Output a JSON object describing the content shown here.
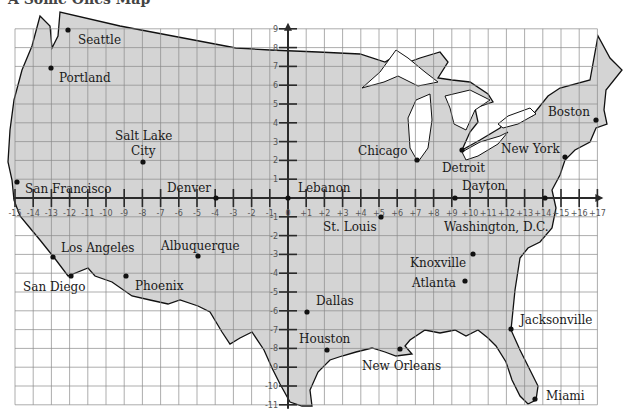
{
  "title_fragment": "A Some Ones Map",
  "grid": {
    "origin_px": [
      288,
      198
    ],
    "unit_x_px": 18.2,
    "unit_y_px": 18.8,
    "x_range": [
      -15,
      17
    ],
    "y_range": [
      -11,
      9
    ],
    "colors": {
      "land": "#d4d4d4",
      "water": "#ffffff",
      "grid": "#8a8a8a",
      "axis": "#2a2a2a",
      "outline": "#111111"
    }
  },
  "x_tick_labels": [
    "-15",
    "-14",
    "-13",
    "-12",
    "-11",
    "-10",
    "-9",
    "-8",
    "-7",
    "-6",
    "-5",
    "-4",
    "-3",
    "-2",
    "-1",
    "0",
    "+1",
    "+2",
    "+3",
    "+4",
    "+5",
    "+6",
    "+7",
    "+8",
    "+9",
    "+10",
    "+11",
    "+12",
    "+13",
    "+14",
    "+15",
    "+16",
    "+17"
  ],
  "y_tick_labels": [
    "9",
    "8",
    "7",
    "6",
    "5",
    "4",
    "3",
    "2",
    "1",
    "-1",
    "-2",
    "-3",
    "-4",
    "-5",
    "-6",
    "-7",
    "-8",
    "-9",
    "-10",
    "-11"
  ],
  "cities": [
    {
      "name": "Seattle",
      "dot": [
        68,
        30
      ],
      "label": [
        78,
        44
      ]
    },
    {
      "name": "Portland",
      "dot": [
        51,
        68
      ],
      "label": [
        59,
        82
      ]
    },
    {
      "name": "Salt Lake",
      "dot": [
        143,
        162
      ],
      "label": [
        115,
        140
      ]
    },
    {
      "name": "City",
      "dot": null,
      "label": [
        131,
        155
      ]
    },
    {
      "name": "San Francisco",
      "dot": [
        17,
        182
      ],
      "label": [
        25,
        193
      ]
    },
    {
      "name": "Denver",
      "dot": [
        216,
        198
      ],
      "label": [
        167,
        192
      ]
    },
    {
      "name": "Lebanon",
      "dot": [
        288,
        198
      ],
      "label": [
        298,
        192
      ]
    },
    {
      "name": "Chicago",
      "dot": [
        417,
        160
      ],
      "label": [
        358,
        155
      ]
    },
    {
      "name": "Detroit",
      "dot": [
        462,
        150
      ],
      "label": [
        442,
        172
      ]
    },
    {
      "name": "Dayton",
      "dot": [
        455,
        198
      ],
      "label": [
        462,
        190
      ]
    },
    {
      "name": "Boston",
      "dot": [
        596,
        120
      ],
      "label": [
        548,
        116
      ]
    },
    {
      "name": "New York",
      "dot": [
        565,
        157
      ],
      "label": [
        501,
        153
      ]
    },
    {
      "name": "Washington, D.C.",
      "dot": [
        545,
        198
      ],
      "label": [
        444,
        231
      ]
    },
    {
      "name": "St. Louis",
      "dot": [
        381,
        217
      ],
      "label": [
        323,
        231
      ]
    },
    {
      "name": "Los Angeles",
      "dot": [
        53,
        257
      ],
      "label": [
        61,
        252
      ]
    },
    {
      "name": "San Diego",
      "dot": [
        71,
        276
      ],
      "label": [
        23,
        291
      ]
    },
    {
      "name": "Albuquerque",
      "dot": [
        198,
        256
      ],
      "label": [
        161,
        250
      ]
    },
    {
      "name": "Phoenix",
      "dot": [
        126,
        276
      ],
      "label": [
        135,
        290
      ]
    },
    {
      "name": "Knoxville",
      "dot": [
        473,
        254
      ],
      "label": [
        410,
        267
      ]
    },
    {
      "name": "Atlanta",
      "dot": [
        465,
        281
      ],
      "label": [
        412,
        287
      ]
    },
    {
      "name": "Dallas",
      "dot": [
        307,
        312
      ],
      "label": [
        316,
        305
      ]
    },
    {
      "name": "Houston",
      "dot": [
        327,
        350
      ],
      "label": [
        299,
        343
      ]
    },
    {
      "name": "New Orleans",
      "dot": [
        400,
        349
      ],
      "label": [
        362,
        370
      ]
    },
    {
      "name": "Jacksonville",
      "dot": [
        511,
        329
      ],
      "label": [
        520,
        324
      ]
    },
    {
      "name": "Miami",
      "dot": [
        535,
        399
      ],
      "label": [
        546,
        400
      ]
    }
  ]
}
